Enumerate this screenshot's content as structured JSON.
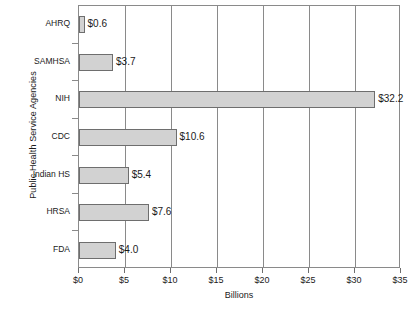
{
  "chart_data": {
    "type": "bar",
    "orientation": "horizontal",
    "title": "",
    "xlabel": "Billions",
    "ylabel": "Public Health Service Agencies",
    "categories": [
      "AHRQ",
      "SAMHSA",
      "NIH",
      "CDC",
      "Indian HS",
      "HRSA",
      "FDA"
    ],
    "values": [
      0.6,
      3.7,
      32.2,
      10.6,
      5.4,
      7.6,
      4.0
    ],
    "data_labels": [
      "$0.6",
      "$3.7",
      "$32.2",
      "$10.6",
      "$5.4",
      "$7.6",
      "$4.0"
    ],
    "xlim": [
      0,
      35
    ],
    "xticks": [
      0,
      5,
      10,
      15,
      20,
      25,
      30,
      35
    ],
    "xtick_labels": [
      "$0",
      "$5",
      "$10",
      "$15",
      "$20",
      "$25",
      "$30",
      "$35"
    ],
    "grid": "vertical",
    "legend": "none",
    "bar_fill_color": "#d2d2d2",
    "bar_border_color": "#6e6e6e",
    "axis_color": "#8a8a8a",
    "background_color": "#ffffff"
  }
}
